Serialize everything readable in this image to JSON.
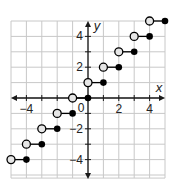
{
  "chart_data": {
    "type": "scatter",
    "subtype": "step-function",
    "title": "",
    "xlabel": "x",
    "ylabel": "y",
    "xlim": [
      -5,
      5
    ],
    "ylim": [
      -5.2,
      5
    ],
    "grid": true,
    "x_tick_labels": [
      "-4",
      "2",
      "4"
    ],
    "x_tick_values": [
      -4,
      2,
      4
    ],
    "y_tick_labels": [
      "4",
      "2",
      "-2",
      "-4"
    ],
    "y_tick_values": [
      4,
      2,
      -2,
      -4
    ],
    "origin_label": "0",
    "segments": [
      {
        "open": [
          -5,
          -4
        ],
        "closed": [
          -4,
          -4
        ]
      },
      {
        "open": [
          -4,
          -3
        ],
        "closed": [
          -3,
          -3
        ]
      },
      {
        "open": [
          -3,
          -2
        ],
        "closed": [
          -2,
          -2
        ]
      },
      {
        "open": [
          -2,
          -1
        ],
        "closed": [
          -1,
          -1
        ]
      },
      {
        "open": [
          -1,
          0
        ],
        "closed": [
          0,
          0
        ]
      },
      {
        "open": [
          0,
          1
        ],
        "closed": [
          1,
          1
        ]
      },
      {
        "open": [
          1,
          2
        ],
        "closed": [
          2,
          2
        ]
      },
      {
        "open": [
          2,
          3
        ],
        "closed": [
          3,
          3
        ]
      },
      {
        "open": [
          3,
          4
        ],
        "closed": [
          4,
          4
        ]
      },
      {
        "open": [
          4,
          5
        ],
        "closed": [
          5,
          5
        ]
      }
    ],
    "colors": {
      "grid": "#c8c8c8",
      "axis": "#1a1a1a",
      "open_fill": "#e6e6e6",
      "closed_fill": "#000000"
    }
  }
}
